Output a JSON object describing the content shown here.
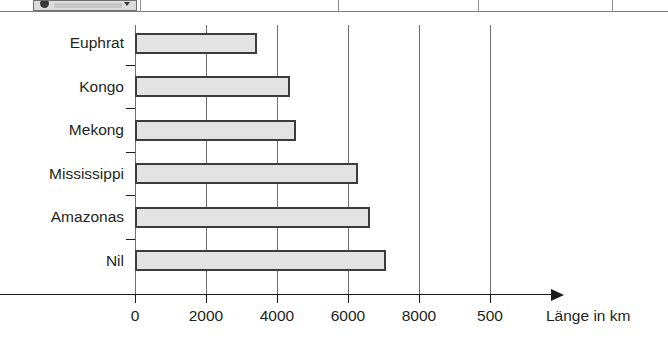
{
  "top_strip": {
    "chip_label": "",
    "icon_left": "circle-icon",
    "icon_right": "chevron-down-icon",
    "divider_count": 4
  },
  "chart_data": {
    "type": "bar",
    "orientation": "horizontal",
    "title": "",
    "xlabel": "Länge in km",
    "ylabel": "",
    "grid": true,
    "legend": false,
    "xlim": [
      0,
      10000
    ],
    "xtick_values": [
      0,
      2000,
      4000,
      6000,
      8000,
      10000
    ],
    "xtick_labels": [
      "0",
      "2000",
      "4000",
      "6000",
      "8000",
      "500"
    ],
    "categories": [
      "Euphrat",
      "Kongo",
      "Mekong",
      "Mississippi",
      "Amazonas",
      "Nil"
    ],
    "values": [
      3450,
      4370,
      4530,
      6280,
      6620,
      7060
    ],
    "bar_fill": "#e3e3e3",
    "bar_border": "#3c3c3c",
    "axis_color": "#1a1a1a",
    "grid_color": "#6e6e6e"
  }
}
